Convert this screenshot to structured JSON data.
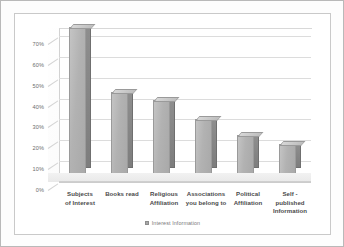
{
  "chart_data": {
    "type": "bar",
    "title": "",
    "subtitle": "",
    "xlabel": "",
    "ylabel": "",
    "categories": [
      "Subjects of Interest",
      "Books read",
      "Religious Affiliation",
      "Associations you belong to",
      "Political Affiliation",
      "Self - published Information"
    ],
    "category_lines": [
      [
        "Subjects",
        "of Interest"
      ],
      [
        "Books read",
        ""
      ],
      [
        "Religious",
        "Affiliation"
      ],
      [
        "Associations",
        "you belong to"
      ],
      [
        "Political",
        "Affiliation"
      ],
      [
        "Self - published",
        "Information"
      ]
    ],
    "series": [
      {
        "name": "Interest Information",
        "values": [
          70,
          39,
          35,
          26,
          18,
          14
        ]
      }
    ],
    "values": [
      70,
      39,
      35,
      26,
      18,
      14
    ],
    "ylim": [
      0,
      70
    ],
    "ytick_values": [
      70,
      60,
      50,
      40,
      30,
      20,
      10,
      0
    ],
    "ytick_labels": [
      "70%",
      "60%",
      "50%",
      "40%",
      "30%",
      "20%",
      "10%",
      "0%"
    ],
    "grid": true,
    "legend_position": "bottom",
    "style": "3d-column",
    "colors": {
      "bar_face": "#b2b2b2",
      "bar_side": "#7d7d7d",
      "bar_top": "#cccccc",
      "gridline": "#dcdcdc",
      "axis_text": "#6d6d6d",
      "category_text": "#4a4a4a",
      "legend_text": "#7a7a7a",
      "frame": "#c9c9c9",
      "background": "#ffffff"
    }
  },
  "legend": {
    "items": [
      {
        "label": "Interest Information"
      }
    ]
  }
}
